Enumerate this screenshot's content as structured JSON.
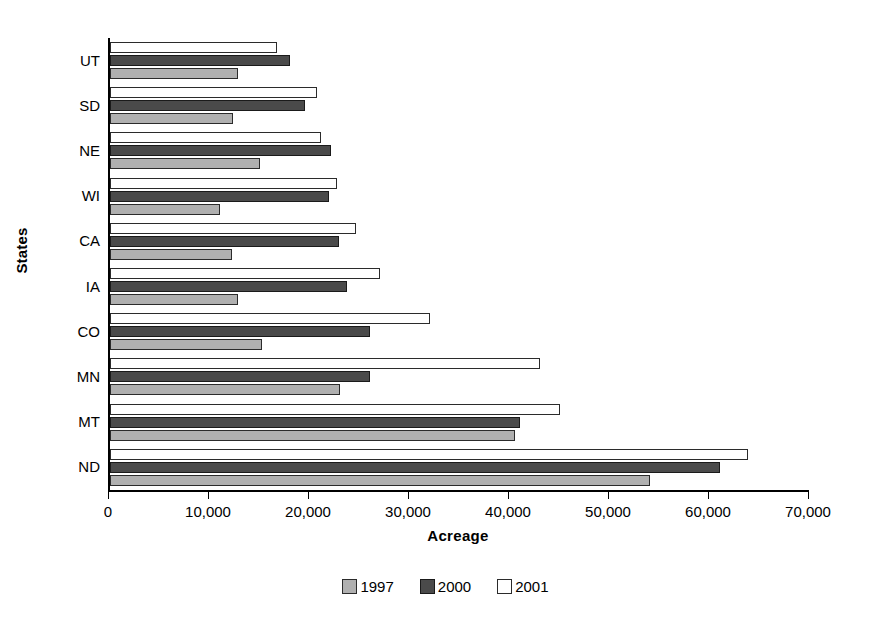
{
  "chart_data": {
    "type": "bar",
    "orientation": "horizontal",
    "title": "",
    "xlabel": "Acreage",
    "ylabel": "States",
    "xlim": [
      0,
      70000
    ],
    "xticks": [
      0,
      10000,
      20000,
      30000,
      40000,
      50000,
      60000,
      70000
    ],
    "xtick_labels": [
      "0",
      "10,000",
      "20,000",
      "30,000",
      "40,000",
      "50,000",
      "60,000",
      "70,000"
    ],
    "grid": false,
    "legend_position": "bottom-center",
    "categories": [
      "ND",
      "MT",
      "MN",
      "CO",
      "IA",
      "CA",
      "WI",
      "NE",
      "SD",
      "UT"
    ],
    "series": [
      {
        "name": "1997",
        "color": "#b0b0b0",
        "values": [
          54000,
          40500,
          23000,
          15200,
          12800,
          12200,
          11000,
          15000,
          12300,
          12800
        ]
      },
      {
        "name": "2000",
        "color": "#4a4a4a",
        "values": [
          61000,
          41000,
          26000,
          26000,
          23700,
          22900,
          21900,
          22100,
          19500,
          18000
        ]
      },
      {
        "name": "2001",
        "color": "#ffffff",
        "values": [
          63800,
          45000,
          43000,
          32000,
          27000,
          24600,
          22700,
          21100,
          20700,
          16700
        ]
      }
    ]
  },
  "legend": {
    "items": [
      {
        "label": "1997",
        "swatch": "y1997"
      },
      {
        "label": "2000",
        "swatch": "y2000"
      },
      {
        "label": "2001",
        "swatch": "y2001"
      }
    ]
  }
}
